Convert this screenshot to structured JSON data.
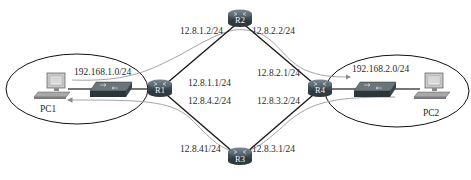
{
  "diagram": {
    "type": "network-topology",
    "routers": [
      {
        "id": "R1",
        "label": "R1",
        "x": 160,
        "y": 89
      },
      {
        "id": "R2",
        "label": "R2",
        "x": 240,
        "y": 21
      },
      {
        "id": "R3",
        "label": "R3",
        "x": 240,
        "y": 158
      },
      {
        "id": "R4",
        "label": "R4",
        "x": 320,
        "y": 89
      }
    ],
    "hosts": [
      {
        "id": "PC1",
        "label": "PC1"
      },
      {
        "id": "PC2",
        "label": "PC2"
      }
    ],
    "lans": [
      {
        "id": "lan1",
        "network": "192.168.1.0/24"
      },
      {
        "id": "lan2",
        "network": "192.168.2.0/24"
      }
    ],
    "interfaces": {
      "r2_r1": "12.8.1.2/24",
      "r2_r4": "12.8.2.2/24",
      "r1_r2": "12.8.1.1/24",
      "r1_r3": "12.8.4.2/24",
      "r4_r2": "12.8.2.1/24",
      "r4_r3": "12.8.3.2/24",
      "r3_r1": "12.8.41/24",
      "r3_r4": "12.8.3.1/24"
    },
    "links": [
      {
        "from": "R1",
        "to": "R2"
      },
      {
        "from": "R2",
        "to": "R4"
      },
      {
        "from": "R1",
        "to": "R3"
      },
      {
        "from": "R3",
        "to": "R4"
      },
      {
        "from": "PC1",
        "to": "R1",
        "via": "switch1"
      },
      {
        "from": "R4",
        "to": "PC2",
        "via": "switch2"
      }
    ],
    "paths": [
      {
        "name": "forward-path",
        "route": [
          "PC1",
          "R1",
          "R2",
          "R4",
          "PC2"
        ],
        "direction": "to PC2"
      },
      {
        "name": "return-path",
        "route": [
          "PC2",
          "R4",
          "R3",
          "R1",
          "PC1"
        ],
        "direction": "to PC1"
      }
    ],
    "colors": {
      "router_body": "#3d4a52",
      "router_top": "#5d6b73",
      "link": "#1a1a1a",
      "path_curve": "#9a9a9a",
      "ellipse": "#111111"
    }
  }
}
